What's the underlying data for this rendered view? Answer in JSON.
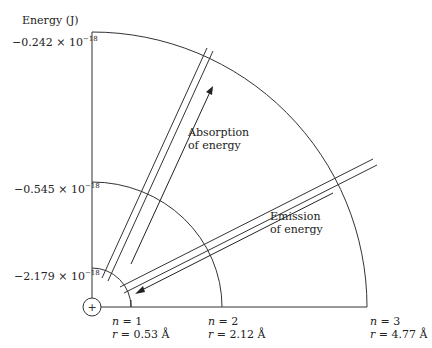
{
  "diagram": {
    "y_axis_label": "Energy (J)",
    "energy_levels": [
      {
        "n": "1",
        "r": "0.53 Å",
        "energy_mantissa": "−2.179 × 10",
        "energy_exp": "−18"
      },
      {
        "n": "2",
        "r": "2.12 Å",
        "energy_mantissa": "−0.545 × 10",
        "energy_exp": "−18"
      },
      {
        "n": "3",
        "r": "4.77 Å",
        "energy_mantissa": "−0.242 × 10",
        "energy_exp": "−18"
      }
    ],
    "nucleus_symbol": "+",
    "absorption_label": [
      "Absorption",
      "of energy"
    ],
    "emission_label": [
      "Emission",
      "of energy"
    ],
    "n_prefix": "n = ",
    "r_prefix": "r = "
  }
}
